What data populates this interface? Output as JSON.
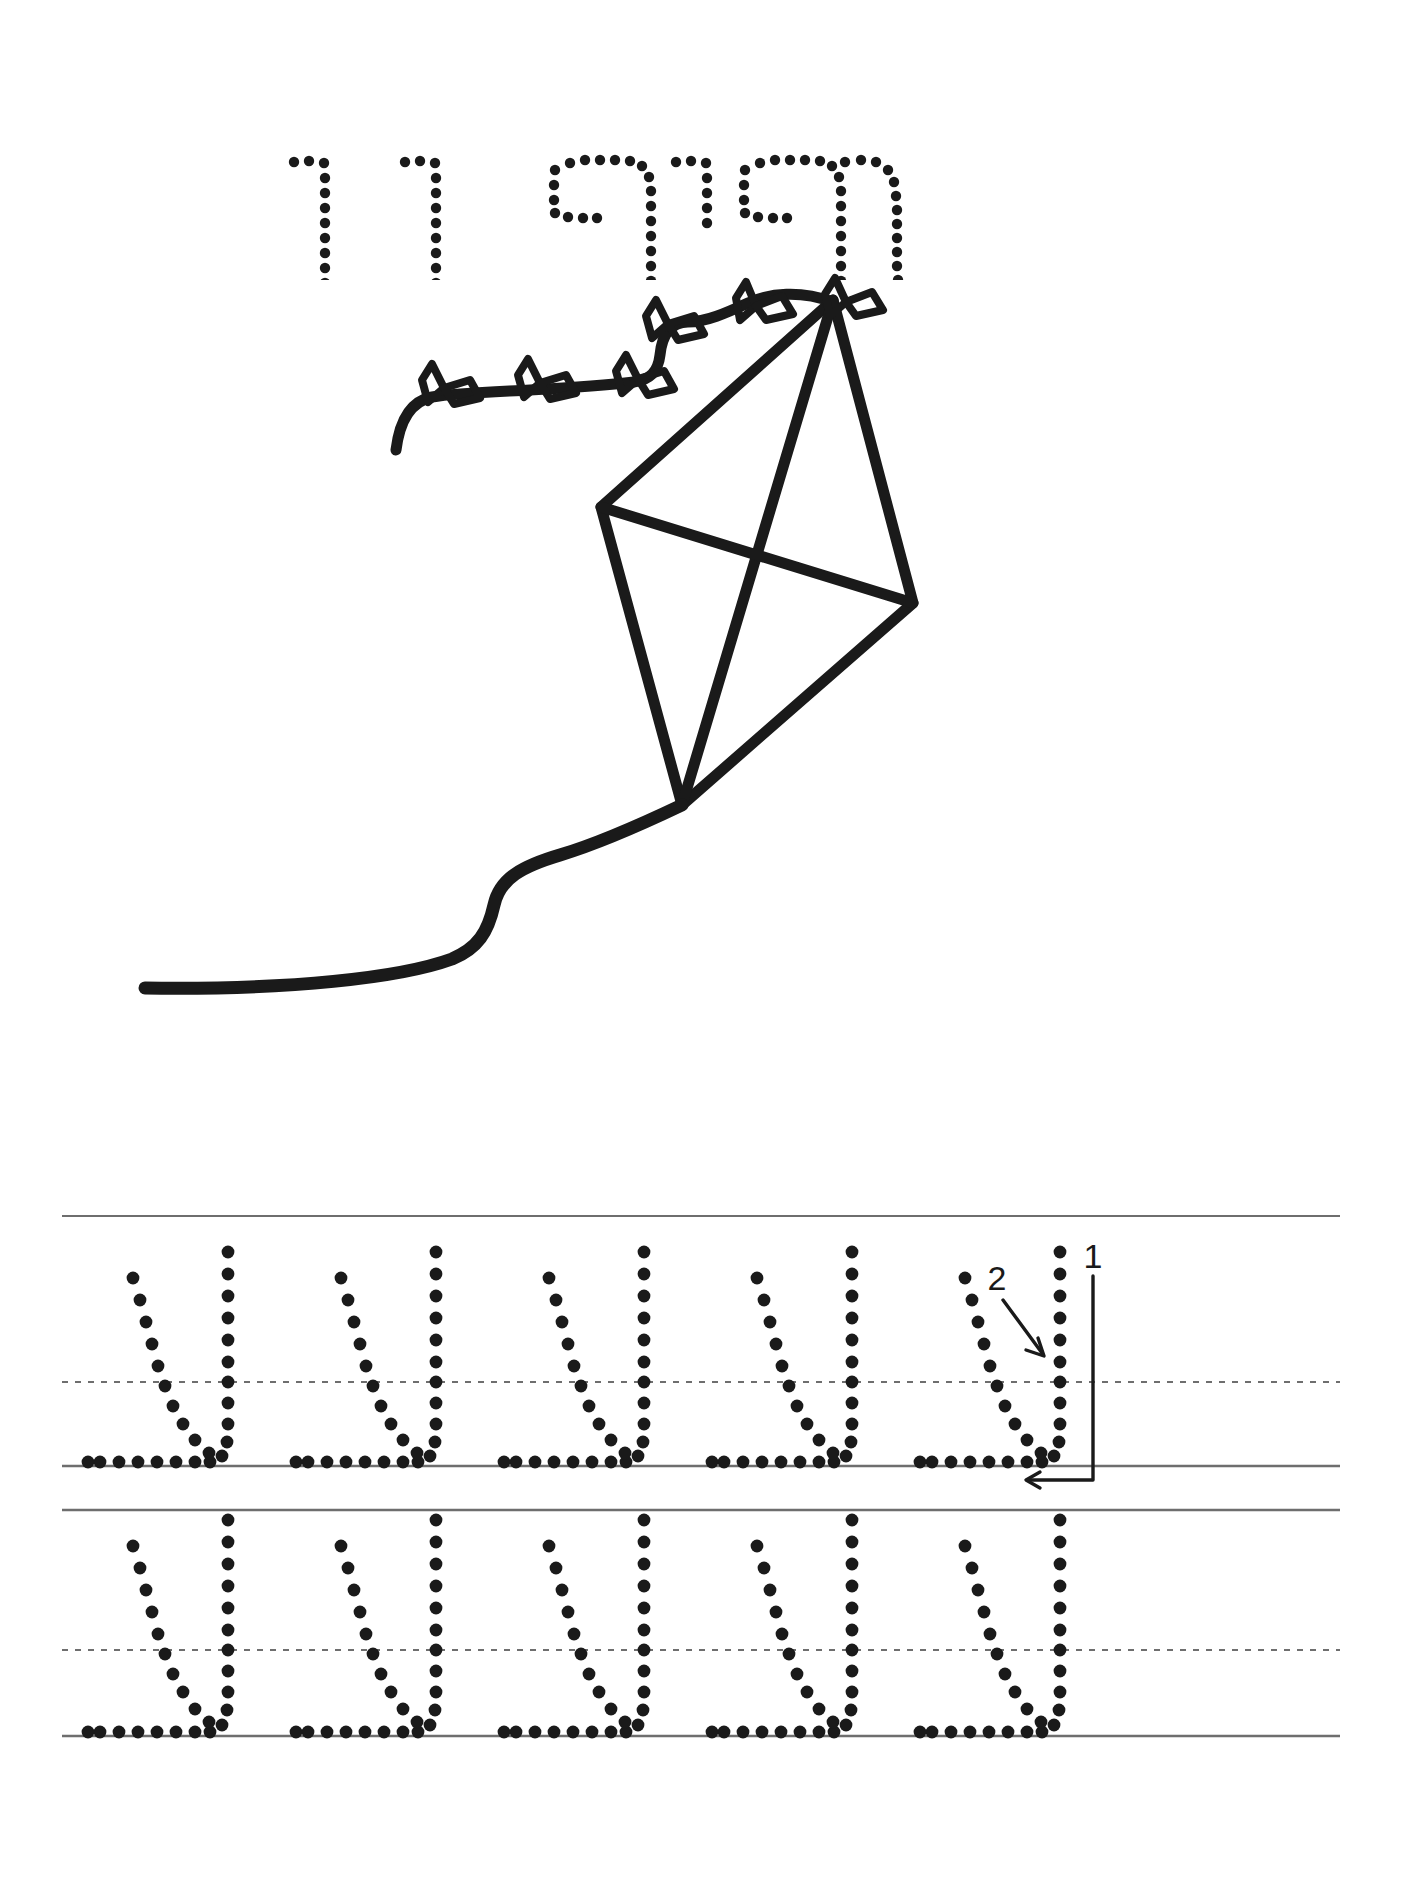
{
  "page": {
    "language": "he",
    "direction": "rtl",
    "kind": "handwriting-tracing-worksheet",
    "background_color": "#ffffff",
    "ink_color": "#1a1a1a",
    "rule_color": "#6e6e6e"
  },
  "title": {
    "word": "עפיפון",
    "translation": "kite",
    "style": "dotted-outline-letters",
    "letters": [
      "ע",
      "פ",
      "י",
      "פ",
      "ו",
      "ן"
    ]
  },
  "illustration": {
    "name": "kite-with-bow-tail",
    "description": "Line-art diamond kite with a wavy tail carrying six bow knots and a long curving string",
    "bow_count": 6,
    "stroke_color": "#1a1a1a"
  },
  "practice": {
    "letter": "ע",
    "letter_name": "ayin",
    "rows": [
      {
        "index": 1,
        "letter_count": 5,
        "has_stroke_guides": true
      },
      {
        "index": 2,
        "letter_count": 5,
        "has_stroke_guides": false
      }
    ],
    "stroke_guides": [
      {
        "number": "1",
        "stroke": "right-vertical-then-left-along-baseline"
      },
      {
        "number": "2",
        "stroke": "diagonal-down-left"
      }
    ],
    "rule_lines": {
      "top_label": "top-rule",
      "mid_label": "dashed-midline",
      "baseline_label": "baseline",
      "bottom_label": "bottom-rule"
    }
  }
}
